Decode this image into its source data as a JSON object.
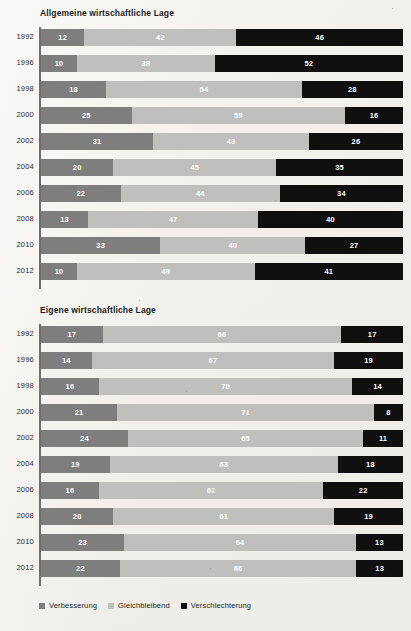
{
  "chart_data": [
    {
      "type": "bar",
      "id": "allgemeine",
      "title": "Allgemeine wirtschaftliche Lage",
      "xlabel": "",
      "ylabel": "",
      "xlim": [
        0,
        100
      ],
      "grid": false,
      "stacked": true,
      "orientation": "horizontal",
      "units": "percent",
      "legend_position": "bottom",
      "categories": [
        "1992",
        "1996",
        "1998",
        "2000",
        "2002",
        "2004",
        "2006",
        "2008",
        "2010",
        "2012"
      ],
      "series": [
        {
          "name": "Verbesserung",
          "color": "#7e7e7e",
          "values": [
            12,
            10,
            18,
            25,
            31,
            20,
            22,
            13,
            33,
            10
          ]
        },
        {
          "name": "Gleichbleibend",
          "color": "#bfbfbd",
          "values": [
            42,
            38,
            54,
            59,
            43,
            45,
            44,
            47,
            40,
            49
          ]
        },
        {
          "name": "Verschlechterung",
          "color": "#100f0f",
          "values": [
            46,
            52,
            28,
            16,
            26,
            35,
            34,
            40,
            27,
            41
          ]
        }
      ]
    },
    {
      "type": "bar",
      "id": "eigene",
      "title": "Eigene wirtschaftliche Lage",
      "xlabel": "",
      "ylabel": "",
      "xlim": [
        0,
        100
      ],
      "grid": false,
      "stacked": true,
      "orientation": "horizontal",
      "units": "percent",
      "legend_position": "bottom",
      "categories": [
        "1992",
        "1996",
        "1998",
        "2000",
        "2002",
        "2004",
        "2006",
        "2008",
        "2010",
        "2012"
      ],
      "series": [
        {
          "name": "Verbesserung",
          "color": "#7e7e7e",
          "values": [
            17,
            14,
            16,
            21,
            24,
            19,
            16,
            20,
            23,
            22
          ]
        },
        {
          "name": "Gleichbleibend",
          "color": "#bfbfbd",
          "values": [
            66,
            67,
            70,
            71,
            65,
            63,
            62,
            61,
            64,
            66
          ]
        },
        {
          "name": "Verschlechterung",
          "color": "#100f0f",
          "values": [
            17,
            19,
            14,
            8,
            11,
            18,
            22,
            19,
            13,
            13
          ]
        }
      ]
    }
  ],
  "legend": {
    "items": [
      {
        "label": "Verbesserung",
        "color": "#7e7e7e"
      },
      {
        "label": "Gleichbleibend",
        "color": "#bfbfbd"
      },
      {
        "label": "Verschlechterung",
        "color": "#100f0f"
      }
    ]
  },
  "colors": {
    "background": "#f2f1ed",
    "axis": "#6f6f6f",
    "improve": "#7e7e7e",
    "same": "#bfbfbd",
    "worse": "#100f0f",
    "text": "#1b1b1b"
  }
}
